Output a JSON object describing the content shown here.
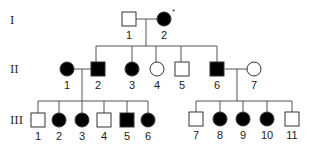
{
  "diagram": {
    "type": "pedigree",
    "colors": {
      "affected": "#000000",
      "unaffected": "#ffffff",
      "stroke": "#333333",
      "line": "#555555"
    },
    "generations": [
      {
        "label": "I",
        "y": 20
      },
      {
        "label": "II",
        "y": 69
      },
      {
        "label": "III",
        "y": 120
      }
    ],
    "individuals": [
      {
        "id": "I-1",
        "gen": 0,
        "num": "1",
        "sex": "male",
        "affected": false,
        "x": 129,
        "y": 19
      },
      {
        "id": "I-2",
        "gen": 0,
        "num": "2",
        "sex": "female",
        "affected": true,
        "x": 164,
        "y": 19,
        "marker": "*"
      },
      {
        "id": "II-1",
        "gen": 1,
        "num": "1",
        "sex": "female",
        "affected": true,
        "x": 67,
        "y": 69
      },
      {
        "id": "II-2",
        "gen": 1,
        "num": "2",
        "sex": "male",
        "affected": true,
        "x": 98,
        "y": 69
      },
      {
        "id": "II-3",
        "gen": 1,
        "num": "3",
        "sex": "female",
        "affected": true,
        "x": 132,
        "y": 69
      },
      {
        "id": "II-4",
        "gen": 1,
        "num": "4",
        "sex": "female",
        "affected": false,
        "x": 157,
        "y": 69
      },
      {
        "id": "II-5",
        "gen": 1,
        "num": "5",
        "sex": "male",
        "affected": false,
        "x": 182,
        "y": 69
      },
      {
        "id": "II-6",
        "gen": 1,
        "num": "6",
        "sex": "male",
        "affected": true,
        "x": 217,
        "y": 69
      },
      {
        "id": "II-7",
        "gen": 1,
        "num": "7",
        "sex": "female",
        "affected": false,
        "x": 254,
        "y": 69
      },
      {
        "id": "III-1",
        "gen": 2,
        "num": "1",
        "sex": "male",
        "affected": false,
        "x": 38,
        "y": 120
      },
      {
        "id": "III-2",
        "gen": 2,
        "num": "2",
        "sex": "female",
        "affected": true,
        "x": 59,
        "y": 120
      },
      {
        "id": "III-3",
        "gen": 2,
        "num": "3",
        "sex": "female",
        "affected": true,
        "x": 82,
        "y": 120
      },
      {
        "id": "III-4",
        "gen": 2,
        "num": "4",
        "sex": "male",
        "affected": false,
        "x": 104,
        "y": 120
      },
      {
        "id": "III-5",
        "gen": 2,
        "num": "5",
        "sex": "male",
        "affected": true,
        "x": 127,
        "y": 120
      },
      {
        "id": "III-6",
        "gen": 2,
        "num": "6",
        "sex": "female",
        "affected": true,
        "x": 148,
        "y": 120
      },
      {
        "id": "III-7",
        "gen": 2,
        "num": "7",
        "sex": "male",
        "affected": false,
        "x": 196,
        "y": 119
      },
      {
        "id": "III-8",
        "gen": 2,
        "num": "8",
        "sex": "female",
        "affected": true,
        "x": 220,
        "y": 119
      },
      {
        "id": "III-9",
        "gen": 2,
        "num": "9",
        "sex": "female",
        "affected": true,
        "x": 243,
        "y": 119
      },
      {
        "id": "III-10",
        "gen": 2,
        "num": "10",
        "sex": "female",
        "affected": true,
        "x": 267,
        "y": 119
      },
      {
        "id": "III-11",
        "gen": 2,
        "num": "11",
        "sex": "male",
        "affected": false,
        "x": 292,
        "y": 119
      }
    ],
    "matings": [
      {
        "partners": [
          "I-1",
          "I-2"
        ],
        "y": 19,
        "x1": 136,
        "x2": 157,
        "descent_x": 146
      },
      {
        "partners": [
          "II-1",
          "II-2"
        ],
        "y": 69,
        "x1": 74,
        "x2": 91,
        "descent_x": 82
      },
      {
        "partners": [
          "II-6",
          "II-7"
        ],
        "y": 69,
        "x1": 225,
        "x2": 247,
        "descent_x": 237
      }
    ],
    "sibships": [
      {
        "parents": "I",
        "y": 46,
        "from_y": 19,
        "descent_x": 146,
        "children_x": [
          96,
          132,
          156,
          181,
          217
        ],
        "child_top_y": 62
      },
      {
        "parents": "II-1xII-2",
        "y": 101,
        "from_y": 69,
        "descent_x": 82,
        "children_x": [
          38,
          59,
          82,
          104,
          127,
          148
        ],
        "child_top_y": 113
      },
      {
        "parents": "II-6xII-7",
        "y": 101,
        "from_y": 69,
        "descent_x": 237,
        "children_x": [
          196,
          220,
          243,
          267,
          292
        ],
        "child_top_y": 112
      }
    ],
    "shape_size": 14
  }
}
